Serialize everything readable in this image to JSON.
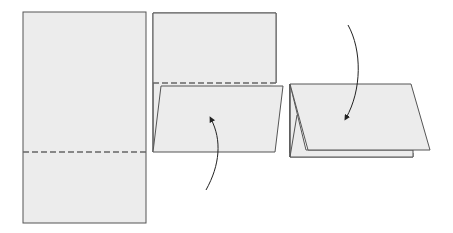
{
  "diagram": {
    "colors": {
      "paper": "#ececec",
      "stroke": "#555555",
      "dash": "#666666",
      "background": "#ffffff"
    },
    "steps": [
      {
        "id": 1,
        "description": "Flat sheet with horizontal fold line (dashed)"
      },
      {
        "id": 2,
        "description": "Bottom edge folded up along dashed line; arrow indicates fold upward"
      },
      {
        "id": 3,
        "description": "Sheet folded into tent shape; arrow indicates fold downward"
      }
    ]
  }
}
